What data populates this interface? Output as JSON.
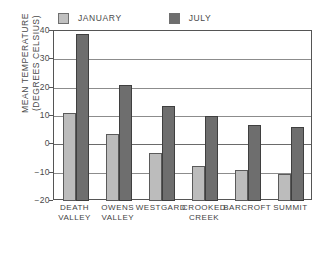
{
  "chart_data": {
    "type": "bar",
    "title": "",
    "xlabel": "",
    "ylabel": "MEAN TEMPERATURE (DEGREES CELSIUS)",
    "ylabel_lines": [
      "MEAN TEMPERATURE",
      "(DEGREES CELSIUS)"
    ],
    "categories": [
      "DEATH VALLEY",
      "OWENS VALLEY",
      "WESTGARD",
      "CROOKED CREEK",
      "BARCROFT",
      "SUMMIT"
    ],
    "category_lines": [
      [
        "DEATH",
        "VALLEY"
      ],
      [
        "OWENS",
        "VALLEY"
      ],
      [
        "WESTGARD"
      ],
      [
        "CROOKED",
        "CREEK"
      ],
      [
        "BARCROFT"
      ],
      [
        "SUMMIT"
      ]
    ],
    "series": [
      {
        "name": "JANUARY",
        "color": "#bcbcbc",
        "values": [
          11,
          3.5,
          -3,
          -7.5,
          -9,
          -10.5
        ]
      },
      {
        "name": "JULY",
        "color": "#6e6e6e",
        "values": [
          39,
          21,
          13.5,
          10,
          7,
          6
        ]
      }
    ],
    "ylim": [
      -20,
      40
    ],
    "yticks": [
      40,
      30,
      20,
      10,
      0,
      -10,
      -20
    ],
    "ytick_labels": [
      "40",
      "30",
      "20",
      "10",
      "0",
      "-10",
      "-20"
    ],
    "grid": true,
    "legend_position": "top-left"
  },
  "legend": {
    "entries": [
      {
        "label": "JANUARY"
      },
      {
        "label": "JULY"
      }
    ]
  },
  "colors": {
    "january": "#bcbcbc",
    "july": "#6e6e6e",
    "axis": "#555555",
    "grid": "#8c8c8c",
    "text": "#4a4a4a",
    "background": "#ffffff"
  }
}
